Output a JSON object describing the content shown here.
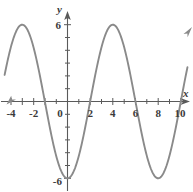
{
  "figure": {
    "kind": "cartesian-graph",
    "background_color": "#ffffff",
    "axis_color": "#5a5a5a",
    "curve_color": "#8a8a8a",
    "label_color": "#3b3b3b"
  },
  "axes": {
    "x_axis_label": "x",
    "y_axis_label": "y",
    "x_tick_labels": [
      "-4",
      "-2",
      "0",
      "2",
      "4",
      "6",
      "8",
      "10"
    ],
    "x_tick_values": [
      -4,
      -2,
      0,
      2,
      4,
      6,
      8,
      10
    ],
    "y_tick_labels": [
      "6",
      "-6"
    ],
    "y_tick_values": [
      6,
      -6
    ],
    "x_range": [
      -6.0,
      11.0
    ],
    "y_range": [
      -7.1,
      7.0
    ],
    "x_minor_ticks": [
      -5,
      -4,
      -3,
      -2,
      -1,
      1,
      2,
      3,
      4,
      5,
      6,
      7,
      8,
      9,
      10
    ],
    "y_minor_ticks": [
      -6,
      -5,
      -4,
      -3,
      -2,
      -1,
      1,
      2,
      3,
      4,
      5,
      6
    ],
    "grid": "off",
    "arrowheads": [
      "x-positive",
      "y-positive"
    ]
  },
  "chart_data": {
    "type": "line",
    "title": "",
    "xlabel": "x",
    "ylabel": "y",
    "xlim": [
      -6.0,
      11.0
    ],
    "ylim": [
      -7.1,
      7.0
    ],
    "grid": false,
    "legend": "none",
    "series": [
      {
        "name": "y = -6 cos(pi x / 4)",
        "amplitude": 6,
        "period": 8,
        "midline": 0,
        "maxima_x": [
          -4,
          4
        ],
        "minima_x": [
          0,
          8
        ],
        "zeros_x": [
          -6,
          -2,
          2,
          6,
          10
        ],
        "x": [
          -6,
          -5.5,
          -5,
          -4.5,
          -4,
          -3.5,
          -3,
          -2.5,
          -2,
          -1.5,
          -1,
          -0.5,
          0,
          0.5,
          1,
          1.5,
          2,
          2.5,
          3,
          3.5,
          4,
          4.5,
          5,
          5.5,
          6,
          6.5,
          7,
          7.5,
          8,
          8.5,
          9,
          9.5,
          10,
          10.5,
          11
        ],
        "y": [
          0,
          2.3,
          4.24,
          5.54,
          6,
          5.54,
          4.24,
          2.3,
          0,
          -2.3,
          -4.24,
          -5.54,
          -6,
          -5.54,
          -4.24,
          -2.3,
          0,
          2.3,
          4.24,
          5.54,
          6,
          5.54,
          4.24,
          2.3,
          0,
          -2.3,
          -4.24,
          -5.54,
          -6,
          -5.54,
          -4.24,
          -2.3,
          0,
          2.3,
          4.24
        ]
      }
    ],
    "annotations": [
      {
        "text": "6",
        "at_axis": "y",
        "value": 6
      },
      {
        "text": "-6",
        "at_axis": "y",
        "value": -6
      }
    ]
  }
}
